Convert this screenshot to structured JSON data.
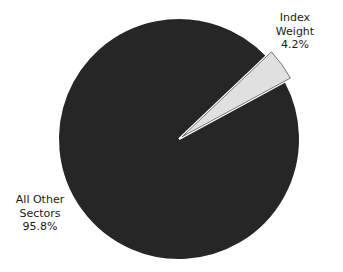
{
  "chart_data": {
    "type": "pie",
    "title": "",
    "categories": [
      "Index Weight",
      "All Other Sectors"
    ],
    "values": [
      4.2,
      95.8
    ],
    "unit": "%",
    "exploded": [
      "Index Weight"
    ],
    "colors": {
      "Index Weight": "#e0e0e0",
      "All Other Sectors": "#262626"
    },
    "legend": "none",
    "labels": [
      {
        "lines": [
          "Index",
          "Weight",
          "4.2%"
        ],
        "position": "upper-right"
      },
      {
        "lines": [
          "All Other",
          "Sectors",
          "95.8%"
        ],
        "position": "lower-left"
      }
    ]
  },
  "labels": {
    "index": {
      "line1": "Index",
      "line2": "Weight",
      "line3": "4.2%"
    },
    "other": {
      "line1": "All Other",
      "line2": "Sectors",
      "line3": "95.8%"
    }
  }
}
